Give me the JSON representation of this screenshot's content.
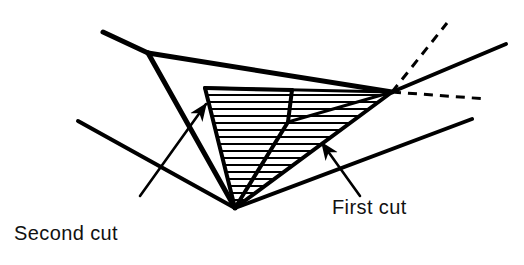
{
  "figure": {
    "kind": "line-drawing",
    "background_color": "#ffffff",
    "ink_color": "#000000"
  },
  "labels": {
    "second_cut": "Second cut",
    "first_cut": "First cut"
  },
  "annotations": {
    "second_cut_leader": {
      "name": "second-cut-leader-arrow",
      "from": [
        140,
        196
      ],
      "to": [
        206,
        104
      ],
      "style": "solid",
      "arrowhead": "at-end"
    },
    "first_cut_leader": {
      "name": "first-cut-leader-arrow",
      "from": [
        360,
        196
      ],
      "to": [
        322,
        143
      ],
      "style": "solid",
      "arrowhead": "at-end"
    }
  },
  "geometry": {
    "vertices": {
      "top_left_node": [
        148,
        53
      ],
      "right_node": [
        392,
        92
      ],
      "apex": [
        235,
        208
      ],
      "hatch_top_left": [
        205,
        88
      ],
      "hatch_mid_node": [
        288,
        122
      ],
      "upper_mid_node": [
        292,
        90
      ]
    },
    "solid_lines": [
      {
        "name": "upper-left-ray",
        "from": [
          103,
          32
        ],
        "to": [
          148,
          53
        ],
        "weight": 5
      },
      {
        "name": "top-ridge",
        "from": [
          148,
          53
        ],
        "to": [
          392,
          92
        ],
        "weight": 5
      },
      {
        "name": "upper-right-ray",
        "from": [
          392,
          92
        ],
        "to": [
          506,
          44
        ],
        "weight": 4
      },
      {
        "name": "left-face-edge",
        "from": [
          148,
          53
        ],
        "to": [
          235,
          208
        ],
        "weight": 5
      },
      {
        "name": "left-lower-ray",
        "from": [
          78,
          121
        ],
        "to": [
          235,
          208
        ],
        "weight": 4
      },
      {
        "name": "right-lower-ray",
        "from": [
          235,
          208
        ],
        "to": [
          472,
          119
        ],
        "weight": 4
      },
      {
        "name": "hatch-left-edge",
        "from": [
          205,
          88
        ],
        "to": [
          235,
          208
        ],
        "weight": 4
      },
      {
        "name": "hatch-right-edge",
        "from": [
          392,
          92
        ],
        "to": [
          235,
          208
        ],
        "weight": 4
      },
      {
        "name": "hatch-top-edge",
        "from": [
          205,
          88
        ],
        "to": [
          392,
          92
        ],
        "weight": 3
      },
      {
        "name": "inner-crease-upper",
        "from": [
          205,
          88
        ],
        "to": [
          292,
          90
        ],
        "weight": 4
      },
      {
        "name": "inner-crease-mid",
        "from": [
          292,
          90
        ],
        "to": [
          288,
          122
        ],
        "weight": 4
      },
      {
        "name": "inner-crease-to-apex",
        "from": [
          288,
          122
        ],
        "to": [
          235,
          208
        ],
        "weight": 4
      },
      {
        "name": "inner-crease-right",
        "from": [
          288,
          122
        ],
        "to": [
          392,
          92
        ],
        "weight": 3
      }
    ],
    "dashed_lines": [
      {
        "name": "dashed-upper-ray",
        "from": [
          392,
          92
        ],
        "to": [
          447,
          23
        ],
        "weight": 3
      },
      {
        "name": "dashed-right-ray",
        "from": [
          392,
          92
        ],
        "to": [
          487,
          99
        ],
        "weight": 3
      }
    ],
    "hatching": {
      "name": "cut-face-hatching",
      "orientation": "horizontal",
      "line_count": 17,
      "spacing_px": 7,
      "y_start": 95,
      "y_end": 207,
      "weight": 2.2
    }
  }
}
